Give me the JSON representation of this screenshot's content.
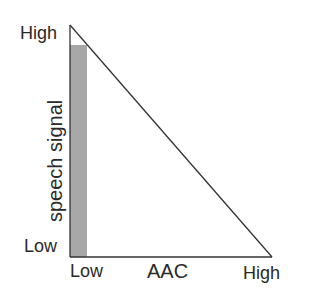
{
  "diagram": {
    "y_axis": {
      "label": "speech signal",
      "high_label": "High",
      "low_label": "Low"
    },
    "x_axis": {
      "label": "AAC",
      "low_label": "Low",
      "high_label": "High"
    },
    "colors": {
      "line": "#333333",
      "bar": "#a8a8a8"
    }
  }
}
